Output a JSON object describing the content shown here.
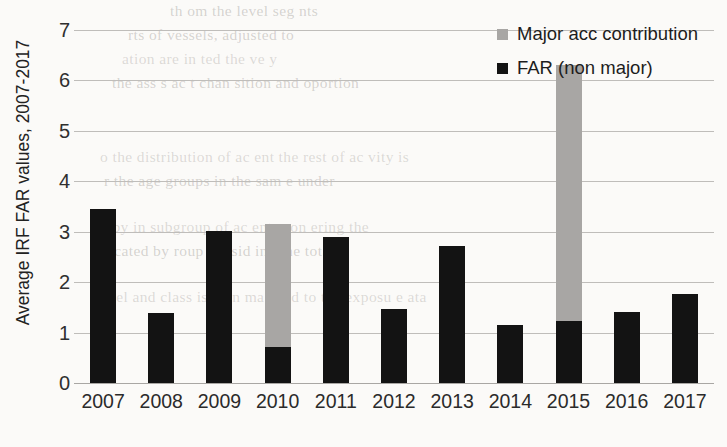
{
  "chart_data": {
    "type": "bar",
    "stacked": true,
    "title": "",
    "xlabel": "",
    "ylabel": "Average IRF FAR values, 2007-2017",
    "categories": [
      "2007",
      "2008",
      "2009",
      "2010",
      "2011",
      "2012",
      "2013",
      "2014",
      "2015",
      "2016",
      "2017"
    ],
    "series": [
      {
        "name": "FAR (non major)",
        "color": "#131313",
        "values": [
          3.45,
          1.38,
          3.02,
          0.72,
          2.9,
          1.47,
          2.72,
          1.15,
          1.22,
          1.4,
          1.77
        ]
      },
      {
        "name": "Major acc contribution",
        "color": "#a8a6a4",
        "values": [
          0,
          0,
          0,
          2.43,
          0,
          0,
          0,
          0,
          5.08,
          0,
          0
        ]
      }
    ],
    "totals": [
      3.45,
      1.38,
      3.02,
      3.15,
      2.9,
      1.47,
      2.72,
      1.15,
      6.3,
      1.4,
      1.77
    ],
    "ylim": [
      0,
      7
    ],
    "yticks": [
      "0",
      "1",
      "2",
      "3",
      "4",
      "5",
      "6",
      "7"
    ],
    "grid": true,
    "legend_position": "top-right"
  },
  "legend": {
    "items": [
      {
        "label": "Major acc contribution",
        "swatch": "#a8a6a4"
      },
      {
        "label": "FAR (non major)",
        "swatch": "#131313"
      }
    ]
  },
  "background_text": {
    "lines": [
      "th        om the      level  seg   nts",
      "rts of vessels, adjusted to",
      "ation  are in   ted  the ve y",
      "the ass    s  ac     t   chan   sition  and   oportion",
      "o  the  distribution  of  ac  ent        the rest  of  ac  vity  is",
      "r  the  age  groups  in  the  sam  e   under",
      "d  by        in    subgroup  of  ac  ents  con    ering   the",
      "ocated  by         roup   consid  ing  the  total",
      "level  and  class  is  then  ma  ched  to  the  exposu  e    ata"
    ]
  }
}
